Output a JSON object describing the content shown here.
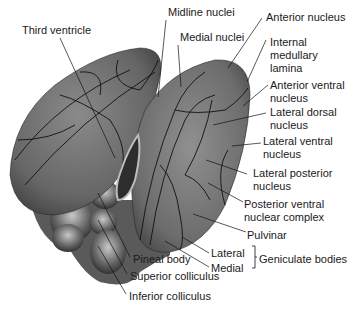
{
  "figure": {
    "colors": {
      "tissue_dark": "#4a4a4a",
      "tissue_mid": "#7a7a7a",
      "tissue_light": "#a8a8a8",
      "outline": "#111111",
      "background": "#ffffff"
    }
  },
  "labels": {
    "third_ventricle": "Third ventricle",
    "midline_nuclei": "Midline nuclei",
    "medial_nuclei": "Medial nuclei",
    "anterior_nucleus": "Anterior nucleus",
    "internal_medullary_lamina_1": "Internal",
    "internal_medullary_lamina_2": "medullary",
    "internal_medullary_lamina_3": "lamina",
    "anterior_ventral_1": "Anterior ventral",
    "anterior_ventral_2": "nucleus",
    "lateral_dorsal_1": "Lateral dorsal",
    "lateral_dorsal_2": "nucleus",
    "lateral_ventral_1": "Lateral ventral",
    "lateral_ventral_2": "nucleus",
    "lateral_posterior_1": "Lateral posterior",
    "lateral_posterior_2": "nucleus",
    "posterior_ventral_1": "Posterior ventral",
    "posterior_ventral_2": "nuclear complex",
    "pulvinar": "Pulvinar",
    "lateral": "Lateral",
    "medial": "Medial",
    "geniculate_bodies": "Geniculate bodies",
    "pineal_body": "Pineal body",
    "superior_colliculus": "Superior colliculus",
    "inferior_colliculus": "Inferior colliculus"
  }
}
